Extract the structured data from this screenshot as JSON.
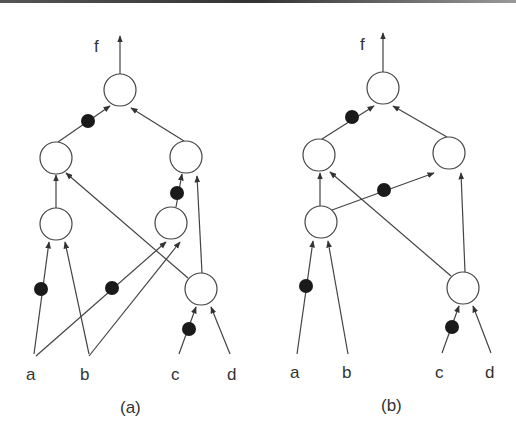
{
  "figure": {
    "panels": [
      {
        "id": "a",
        "caption": "(a)",
        "output_label": "f",
        "inputs": [
          "a",
          "b",
          "c",
          "d"
        ],
        "nodes": [
          {
            "id": "top",
            "x": 120,
            "y": 90
          },
          {
            "id": "mid_left",
            "x": 56,
            "y": 158
          },
          {
            "id": "mid_right",
            "x": 186,
            "y": 157
          },
          {
            "id": "low_left",
            "x": 56,
            "y": 224
          },
          {
            "id": "low_right",
            "x": 171,
            "y": 223
          },
          {
            "id": "bottom_right",
            "x": 201,
            "y": 289
          }
        ],
        "edges": [
          {
            "from": "mid_left",
            "to": "top",
            "inverted": true
          },
          {
            "from": "mid_right",
            "to": "top",
            "inverted": false
          },
          {
            "from": "low_left",
            "to": "mid_left",
            "inverted": false
          },
          {
            "from": "bottom_right",
            "to": "mid_left",
            "inverted": false
          },
          {
            "from": "low_right",
            "to": "mid_right",
            "inverted": true
          },
          {
            "from": "bottom_right",
            "to": "mid_right",
            "inverted": false
          },
          {
            "from": "a",
            "to": "low_left",
            "inverted": true
          },
          {
            "from": "b",
            "to": "low_left",
            "inverted": false
          },
          {
            "from": "a",
            "to": "low_right",
            "inverted": true
          },
          {
            "from": "b",
            "to": "low_right",
            "inverted": false
          },
          {
            "from": "c",
            "to": "bottom_right",
            "inverted": true
          },
          {
            "from": "d",
            "to": "bottom_right",
            "inverted": false
          }
        ]
      },
      {
        "id": "b",
        "caption": "(b)",
        "output_label": "f",
        "inputs": [
          "a",
          "b",
          "c",
          "d"
        ],
        "nodes": [
          {
            "id": "top",
            "x": 383,
            "y": 88
          },
          {
            "id": "mid_left",
            "x": 319,
            "y": 155
          },
          {
            "id": "mid_right",
            "x": 449,
            "y": 153
          },
          {
            "id": "low_left",
            "x": 321,
            "y": 222
          },
          {
            "id": "bottom_right",
            "x": 463,
            "y": 288
          }
        ],
        "edges": [
          {
            "from": "mid_left",
            "to": "top",
            "inverted": true
          },
          {
            "from": "mid_right",
            "to": "top",
            "inverted": false
          },
          {
            "from": "low_left",
            "to": "mid_left",
            "inverted": false
          },
          {
            "from": "bottom_right",
            "to": "mid_left",
            "inverted": false
          },
          {
            "from": "low_left",
            "to": "mid_right",
            "inverted": true
          },
          {
            "from": "bottom_right",
            "to": "mid_right",
            "inverted": false
          },
          {
            "from": "a",
            "to": "low_left",
            "inverted": true
          },
          {
            "from": "b",
            "to": "low_left",
            "inverted": false
          },
          {
            "from": "c",
            "to": "bottom_right",
            "inverted": true
          },
          {
            "from": "d",
            "to": "bottom_right",
            "inverted": false
          }
        ]
      }
    ]
  },
  "labels": {
    "a": {
      "f": "f",
      "in_a": "a",
      "in_b": "b",
      "in_c": "c",
      "in_d": "d",
      "caption": "(a)"
    },
    "b": {
      "f": "f",
      "in_a": "a",
      "in_b": "b",
      "in_c": "c",
      "in_d": "d",
      "caption": "(b)"
    }
  },
  "colors": {
    "stroke": "#333333",
    "inverter_dot": "#1a1a1a",
    "background": "#ffffff"
  }
}
